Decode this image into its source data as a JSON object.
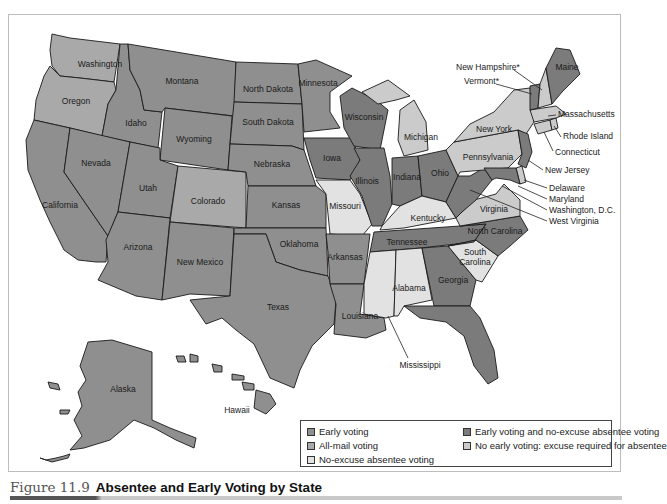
{
  "caption": {
    "figure_number": "Figure 11.9",
    "title": "Absentee and Early Voting by State"
  },
  "colors": {
    "early_voting": "#8f8f8f",
    "all_mail": "#a9a9a9",
    "no_excuse_absentee": "#e2e2e2",
    "early_and_no_excuse": "#7b7b7b",
    "no_early_excuse_required": "#cbcbcb",
    "water": "#ffffff",
    "border": "#1a1a1a"
  },
  "legend": {
    "items": [
      {
        "key": "early_voting",
        "label": "Early voting"
      },
      {
        "key": "all_mail",
        "label": "All-mail voting"
      },
      {
        "key": "no_excuse_absentee",
        "label": "No-excuse absentee voting"
      },
      {
        "key": "early_and_no_excuse",
        "label": "Early voting and no-excuse absentee voting"
      },
      {
        "key": "no_early_excuse_required",
        "label": "No early voting: excuse required for absentee"
      }
    ]
  },
  "states": {
    "washington": "Washington",
    "oregon": "Oregon",
    "california": "California",
    "idaho": "Idaho",
    "nevada": "Nevada",
    "montana": "Montana",
    "wyoming": "Wyoming",
    "utah": "Utah",
    "arizona": "Arizona",
    "colorado": "Colorado",
    "new_mexico": "New Mexico",
    "north_dakota": "North Dakota",
    "south_dakota": "South Dakota",
    "nebraska": "Nebraska",
    "kansas": "Kansas",
    "oklahoma": "Oklahoma",
    "texas": "Texas",
    "minnesota": "Minnesota",
    "iowa": "Iowa",
    "missouri": "Missouri",
    "arkansas": "Arkansas",
    "louisiana": "Louisiana",
    "wisconsin": "Wisconsin",
    "illinois": "Illinois",
    "michigan": "Michigan",
    "indiana": "Indiana",
    "ohio": "Ohio",
    "kentucky": "Kentucky",
    "tennessee": "Tennessee",
    "mississippi": "Mississippi",
    "alabama": "Alabama",
    "georgia": "Georgia",
    "florida": "Florida",
    "south_carolina_1": "South",
    "south_carolina_2": "Carolina",
    "north_carolina": "North Carolina",
    "virginia": "Virginia",
    "west_virginia": "West Virginia",
    "pennsylvania": "Pennsylvania",
    "new_york": "New York",
    "new_jersey": "New Jersey",
    "delaware": "Delaware",
    "maryland": "Maryland",
    "washington_dc": "Washington, D.C.",
    "connecticut": "Connecticut",
    "rhode_island": "Rhode Island",
    "massachusetts": "Massachusetts",
    "vermont": "Vermont*",
    "new_hampshire": "New Hampshire*",
    "maine": "Maine",
    "alaska": "Alaska",
    "hawaii": "Hawaii"
  }
}
